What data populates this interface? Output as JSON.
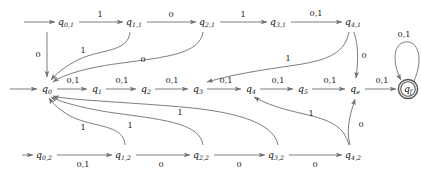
{
  "diagram": {
    "alphabet": [
      "0",
      "1"
    ],
    "stroke_color": "#6f6f6f",
    "text_color": "#1a1a1a",
    "accept_state": "q_f",
    "start_arrows": [
      "q_{0,1}",
      "q_0",
      "q_{0,2}"
    ],
    "nodes": [
      {
        "id": "q01",
        "label": "q",
        "sub": "0,1",
        "x": 66,
        "y": 22,
        "row": "top"
      },
      {
        "id": "q11",
        "label": "q",
        "sub": "1,1",
        "x": 134,
        "y": 22,
        "row": "top"
      },
      {
        "id": "q21",
        "label": "q",
        "sub": "2,1",
        "x": 207,
        "y": 22,
        "row": "top"
      },
      {
        "id": "q31",
        "label": "q",
        "sub": "3,1",
        "x": 278,
        "y": 22,
        "row": "top"
      },
      {
        "id": "q41",
        "label": "q",
        "sub": "4,1",
        "x": 353,
        "y": 22,
        "row": "top"
      },
      {
        "id": "q0",
        "label": "q",
        "sub": "0",
        "x": 47,
        "y": 89,
        "row": "mid"
      },
      {
        "id": "q1",
        "label": "q",
        "sub": "1",
        "x": 97,
        "y": 89,
        "row": "mid"
      },
      {
        "id": "q2",
        "label": "q",
        "sub": "2",
        "x": 146,
        "y": 89,
        "row": "mid"
      },
      {
        "id": "q3",
        "label": "q",
        "sub": "3",
        "x": 198,
        "y": 89,
        "row": "mid"
      },
      {
        "id": "q4",
        "label": "q",
        "sub": "4",
        "x": 251,
        "y": 89,
        "row": "mid"
      },
      {
        "id": "q5",
        "label": "q",
        "sub": "5",
        "x": 303,
        "y": 89,
        "row": "mid"
      },
      {
        "id": "qe",
        "label": "q",
        "sub": "e",
        "x": 355,
        "y": 89,
        "row": "mid"
      },
      {
        "id": "qf",
        "label": "q",
        "sub": "f",
        "x": 408,
        "y": 89,
        "row": "mid",
        "accept": true
      },
      {
        "id": "q02",
        "label": "q",
        "sub": "0,2",
        "x": 44,
        "y": 155,
        "row": "bot"
      },
      {
        "id": "q12",
        "label": "q",
        "sub": "1,2",
        "x": 123,
        "y": 155,
        "row": "bot"
      },
      {
        "id": "q22",
        "label": "q",
        "sub": "2,2",
        "x": 201,
        "y": 155,
        "row": "bot"
      },
      {
        "id": "q32",
        "label": "q",
        "sub": "3,2",
        "x": 276,
        "y": 155,
        "row": "bot"
      },
      {
        "id": "q42",
        "label": "q",
        "sub": "4,2",
        "x": 353,
        "y": 155,
        "row": "bot"
      }
    ],
    "edges": [
      {
        "id": "e-q01-q11",
        "from": "q_{0,1}",
        "to": "q_{1,1}",
        "label": "1",
        "lx": 100,
        "ly": 14
      },
      {
        "id": "e-q11-q21",
        "from": "q_{1,1}",
        "to": "q_{2,1}",
        "label": "0",
        "lx": 171,
        "ly": 14
      },
      {
        "id": "e-q21-q31",
        "from": "q_{2,1}",
        "to": "q_{3,1}",
        "label": "1",
        "lx": 243,
        "ly": 14
      },
      {
        "id": "e-q31-q41",
        "from": "q_{3,1}",
        "to": "q_{4,1}",
        "label": "0,1",
        "lx": 316,
        "ly": 13
      },
      {
        "id": "e-q01-q0",
        "from": "q_{0,1}",
        "to": "q_0",
        "label": "0",
        "lx": 38,
        "ly": 54
      },
      {
        "id": "e-q11-q0",
        "from": "q_{1,1}",
        "to": "q_0",
        "label": "1",
        "lx": 83,
        "ly": 50
      },
      {
        "id": "e-q21-q0",
        "from": "q_{2,1}",
        "to": "q_0",
        "label": "0",
        "lx": 143,
        "ly": 59
      },
      {
        "id": "e-q31-q4",
        "from": "q_{3,1}",
        "to": "q_4",
        "label": "1",
        "lx": 288,
        "ly": 58
      },
      {
        "id": "e-q41-qe",
        "from": "q_{4,1}",
        "to": "q_e",
        "label": "0",
        "lx": 364,
        "ly": 55
      },
      {
        "id": "e-q0-q1",
        "from": "q_0",
        "to": "q_1",
        "label": "0,1",
        "lx": 73,
        "ly": 80
      },
      {
        "id": "e-q1-q2",
        "from": "q_1",
        "to": "q_2",
        "label": "0,1",
        "lx": 122,
        "ly": 80
      },
      {
        "id": "e-q2-q3",
        "from": "q_2",
        "to": "q_3",
        "label": "0,1",
        "lx": 172,
        "ly": 80
      },
      {
        "id": "e-q3-q4",
        "from": "q_3",
        "to": "q_4",
        "label": "0,1",
        "lx": 226,
        "ly": 80
      },
      {
        "id": "e-q4-q5",
        "from": "q_4",
        "to": "q_5",
        "label": "0,1",
        "lx": 278,
        "ly": 80
      },
      {
        "id": "e-q5-qe",
        "from": "q_5",
        "to": "q_e",
        "label": "0,1",
        "lx": 330,
        "ly": 80
      },
      {
        "id": "e-qe-qf",
        "from": "q_e",
        "to": "q_f",
        "label": "0,1",
        "lx": 382,
        "ly": 80
      },
      {
        "id": "e-qf-qf",
        "from": "q_f",
        "to": "q_f",
        "label": "0,1",
        "lx": 404,
        "ly": 49
      },
      {
        "id": "e-q02-q12",
        "from": "q_{0,2}",
        "to": "q_{1,2}",
        "label": "0,1",
        "lx": 83,
        "ly": 164
      },
      {
        "id": "e-q12-q22",
        "from": "q_{1,2}",
        "to": "q_{2,2}",
        "label": "0",
        "lx": 161,
        "ly": 164
      },
      {
        "id": "e-q22-q32",
        "from": "q_{2,2}",
        "to": "q_{3,2}",
        "label": "0",
        "lx": 239,
        "ly": 164
      },
      {
        "id": "e-q32-q42",
        "from": "q_{3,2}",
        "to": "q_{4,2}",
        "label": "0",
        "lx": 315,
        "ly": 164
      },
      {
        "id": "e-q12-q0",
        "from": "q_{1,2}",
        "to": "q_0",
        "label": "1",
        "lx": 83,
        "ly": 127
      },
      {
        "id": "e-q22-q0",
        "from": "q_{2,2}",
        "to": "q_0",
        "label": "1",
        "lx": 130,
        "ly": 125
      },
      {
        "id": "e-q32-q0",
        "from": "q_{3,2}",
        "to": "q_0",
        "label": "1",
        "lx": 180,
        "ly": 112
      },
      {
        "id": "e-q32-q4",
        "from": "q_{3,2}",
        "to": "q_4",
        "label": "1",
        "lx": 311,
        "ly": 113
      },
      {
        "id": "e-q42-qe",
        "from": "q_{4,2}",
        "to": "q_e",
        "label": "0",
        "lx": 361,
        "ly": 124
      }
    ]
  }
}
